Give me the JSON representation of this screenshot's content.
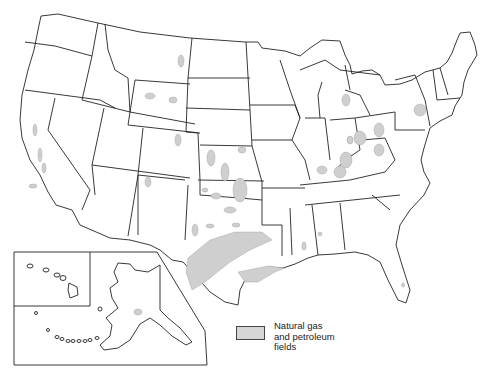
{
  "map": {
    "subject": "United States natural gas and petroleum fields",
    "insets": [
      "Hawaii",
      "Alaska"
    ],
    "colors": {
      "state_fill": "#ffffff",
      "border": "#222222",
      "field_fill": "#cfcfcf"
    }
  },
  "legend": {
    "label_lines": [
      "Natural gas",
      "and petroleum",
      "fields"
    ]
  }
}
